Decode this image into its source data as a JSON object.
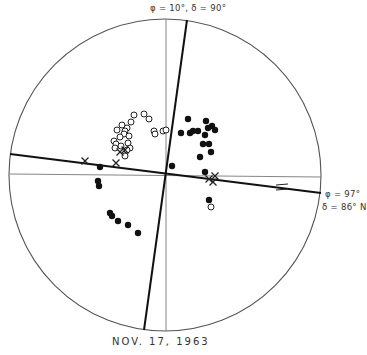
{
  "figure": {
    "top_label": "φ = 10°,  δ = 90°",
    "right_label_1": "φ = 97°",
    "right_label_2": "δ = 86° N",
    "caption": "NOV.  17,  1963"
  },
  "chart_data": {
    "type": "scatter",
    "title": "NOV. 17, 1963",
    "projection": "stereographic / equal-area focal sphere",
    "nodal_planes": [
      {
        "label": "φ = 10°, δ = 90°",
        "line": [
          [
            187,
            20
          ],
          [
            144,
            330
          ]
        ]
      },
      {
        "label": "φ = 97°, δ = 86° N",
        "line": [
          [
            10,
            154
          ],
          [
            321,
            193
          ]
        ]
      }
    ],
    "axes_lines": {
      "vertical_x": 166,
      "horizontal": [
        [
          10,
          174
        ],
        [
          321,
          177
        ]
      ]
    },
    "circle": {
      "cx": 165,
      "cy": 175,
      "r": 156
    },
    "series": [
      {
        "name": "compression (filled)",
        "marker": "filled-circle",
        "points": [
          [
            188,
            119
          ],
          [
            206,
            121
          ],
          [
            212,
            126
          ],
          [
            215,
            130
          ],
          [
            208,
            128
          ],
          [
            190,
            133
          ],
          [
            193,
            131
          ],
          [
            198,
            131
          ],
          [
            181,
            133
          ],
          [
            205,
            135
          ],
          [
            203,
            144
          ],
          [
            209,
            144
          ],
          [
            211,
            152
          ],
          [
            200,
            157
          ],
          [
            172,
            166
          ],
          [
            205,
            172
          ],
          [
            100,
            167
          ],
          [
            98,
            181
          ],
          [
            99,
            186
          ],
          [
            110,
            213
          ],
          [
            112,
            216
          ],
          [
            118,
            221
          ],
          [
            128,
            225
          ],
          [
            138,
            233
          ],
          [
            209,
            200
          ]
        ]
      },
      {
        "name": "dilatation (open)",
        "marker": "open-circle",
        "points": [
          [
            134,
            115
          ],
          [
            144,
            114
          ],
          [
            149,
            119
          ],
          [
            131,
            122
          ],
          [
            122,
            125
          ],
          [
            127,
            128
          ],
          [
            117,
            130
          ],
          [
            125,
            131
          ],
          [
            124,
            134
          ],
          [
            120,
            137
          ],
          [
            129,
            136
          ],
          [
            114,
            141
          ],
          [
            116,
            144
          ],
          [
            121,
            146
          ],
          [
            115,
            148
          ],
          [
            128,
            143
          ],
          [
            130,
            148
          ],
          [
            127,
            150
          ],
          [
            154,
            131
          ],
          [
            155,
            134
          ],
          [
            163,
            131
          ],
          [
            166,
            130
          ],
          [
            211,
            207
          ],
          [
            125,
            156
          ]
        ]
      },
      {
        "name": "ambiguous (cross)",
        "marker": "cross",
        "points": [
          [
            125,
            150
          ],
          [
            85,
            161
          ],
          [
            116,
            163
          ],
          [
            209,
            179
          ],
          [
            213,
            182
          ],
          [
            215,
            176
          ],
          [
            120,
            152
          ]
        ]
      }
    ],
    "annotations": [
      {
        "type": "equals-mark",
        "at": [
          282,
          187
        ]
      }
    ]
  }
}
